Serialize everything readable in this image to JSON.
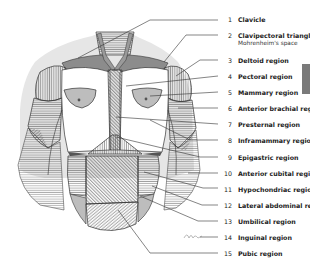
{
  "figure": {
    "labels": [
      {
        "n": "1",
        "text": "Clavicle",
        "y": 16
      },
      {
        "n": "2",
        "text": "Clavipectoral triangle",
        "sub": "Mohrenheim's space",
        "y": 33
      },
      {
        "n": "3",
        "text": "Deltoid region",
        "y": 57
      },
      {
        "n": "4",
        "text": "Pectoral region",
        "y": 73
      },
      {
        "n": "5",
        "text": "Mammary region",
        "y": 89
      },
      {
        "n": "6",
        "text": "Anterior brachial region",
        "y": 105
      },
      {
        "n": "7",
        "text": "Presternal region",
        "y": 121
      },
      {
        "n": "8",
        "text": "Inframammary region",
        "y": 137
      },
      {
        "n": "9",
        "text": "Epigastric region",
        "y": 154
      },
      {
        "n": "10",
        "text": "Anterior cubital region",
        "y": 170
      },
      {
        "n": "11",
        "text": "Hypochondriac region",
        "y": 186
      },
      {
        "n": "12",
        "text": "Lateral abdominal region",
        "y": 202
      },
      {
        "n": "13",
        "text": "Umbilical region",
        "y": 218
      },
      {
        "n": "14",
        "text": "Inguinal region",
        "y": 234
      },
      {
        "n": "15",
        "text": "Pubic region",
        "y": 250
      }
    ]
  },
  "colors": {
    "tab": "#7a7a7a",
    "line": "#333333",
    "hatch": "#555555",
    "shade": "#9a9a9a",
    "skin": "#ffffff"
  }
}
